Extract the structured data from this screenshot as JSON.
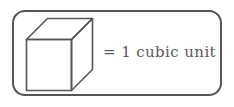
{
  "legend": {
    "equation_text": "= 1 cubic unit",
    "shape_name": "cube",
    "shape_description": "isometric cube outline",
    "colors": {
      "background": "#ffffff",
      "stroke": "#555555",
      "text": "#5a5a5a",
      "frame_border": "#555555"
    },
    "frame": {
      "shape": "rounded-rectangle",
      "corner_radius": "13px"
    }
  }
}
